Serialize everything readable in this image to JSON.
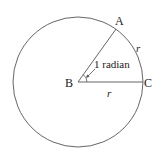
{
  "diagram": {
    "circle": {
      "cx": 78,
      "cy": 82,
      "r": 65,
      "stroke": "#555555"
    },
    "points": {
      "A": {
        "label": "A",
        "x": 117,
        "y": 30
      },
      "B": {
        "label": "B",
        "x": 78,
        "y": 82
      },
      "C": {
        "label": "C",
        "x": 143,
        "y": 82
      }
    },
    "labels": {
      "angle": "1 radian",
      "arc_r": "r",
      "radius_r": "r"
    },
    "colors": {
      "line": "#555555",
      "text": "#222222"
    }
  }
}
